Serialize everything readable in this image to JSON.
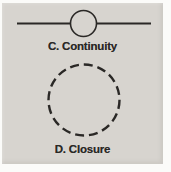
{
  "figures": {
    "continuity": {
      "label": "C. Continuity"
    },
    "closure": {
      "label": "D. Closure"
    }
  },
  "colors": {
    "panel_bg": "#d7d4cf",
    "ink": "#2a2826",
    "page_bg": "#fbfbf9"
  }
}
